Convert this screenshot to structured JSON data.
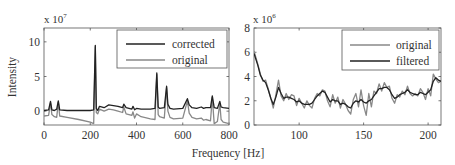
{
  "figure": {
    "xlabel": "Frequency [Hz]",
    "ylabel": "Intensity"
  },
  "chart_data": [
    {
      "type": "line",
      "title": "",
      "xlabel": "Frequency [Hz]",
      "ylabel": "Intensity",
      "y_multiplier": "x 10^7",
      "y_multiplier_base": "x 10",
      "y_multiplier_exp": "7",
      "xlim": [
        0,
        800
      ],
      "ylim": [
        -2,
        12
      ],
      "xticks": [
        0,
        200,
        400,
        600,
        800
      ],
      "yticks": [
        0,
        5,
        10
      ],
      "xtick_labels": [
        "0",
        "200",
        "400",
        "600",
        "800"
      ],
      "ytick_labels": [
        "0",
        "5",
        "10"
      ],
      "grid": false,
      "legend_position": "upper right",
      "legend": [
        "corrected",
        "original"
      ],
      "series": [
        {
          "name": "corrected",
          "color": "#222222",
          "x": [
            0,
            20,
            28,
            34,
            45,
            55,
            62,
            68,
            100,
            150,
            200,
            215,
            222,
            226,
            232,
            240,
            260,
            280,
            300,
            320,
            340,
            345,
            355,
            380,
            385,
            392,
            400,
            420,
            460,
            480,
            488,
            494,
            500,
            520,
            530,
            536,
            545,
            560,
            600,
            620,
            628,
            640,
            660,
            680,
            690,
            700,
            720,
            728,
            736,
            750,
            760,
            766,
            775,
            800
          ],
          "values": [
            0.1,
            0.2,
            1.4,
            0.2,
            0.1,
            0.3,
            1.5,
            0.2,
            0.1,
            0.1,
            0.1,
            0.2,
            9.5,
            0.4,
            0.1,
            0.7,
            0.5,
            0.9,
            0.8,
            0.7,
            0.5,
            1.0,
            0.5,
            0.3,
            0.7,
            0.2,
            0.4,
            0.3,
            0.3,
            0.4,
            5.5,
            0.6,
            0.4,
            0.5,
            3.6,
            1.0,
            0.4,
            0.3,
            0.4,
            1.8,
            0.9,
            0.5,
            0.4,
            0.6,
            0.4,
            0.5,
            0.5,
            2.2,
            0.5,
            0.4,
            1.4,
            0.6,
            0.5,
            0.4
          ]
        },
        {
          "name": "original",
          "color": "#888888",
          "x": [
            0,
            20,
            28,
            34,
            45,
            55,
            62,
            68,
            100,
            150,
            200,
            215,
            222,
            226,
            232,
            240,
            260,
            280,
            300,
            320,
            340,
            345,
            355,
            380,
            385,
            392,
            400,
            420,
            460,
            480,
            488,
            494,
            500,
            520,
            530,
            536,
            545,
            560,
            600,
            620,
            628,
            640,
            660,
            680,
            690,
            700,
            720,
            728,
            736,
            750,
            760,
            766,
            775,
            800
          ],
          "values": [
            -0.7,
            -0.6,
            1.2,
            -0.5,
            -0.8,
            -0.9,
            1.3,
            -0.7,
            -0.9,
            -1.2,
            -1.6,
            -1.8,
            9.3,
            -0.2,
            -0.4,
            0.3,
            0.0,
            0.3,
            0.2,
            0.0,
            -0.2,
            0.6,
            -0.4,
            -0.6,
            -0.1,
            -1.0,
            -0.4,
            -0.8,
            -1.1,
            -1.2,
            5.3,
            -0.5,
            -0.8,
            -1.0,
            3.4,
            0.0,
            -0.9,
            -1.1,
            -1.0,
            1.5,
            -0.3,
            -0.9,
            -1.1,
            -1.0,
            -1.3,
            -1.2,
            -1.4,
            2.0,
            -1.8,
            -1.5,
            1.1,
            -1.2,
            -1.6,
            -1.8
          ]
        }
      ]
    },
    {
      "type": "line",
      "title": "",
      "xlabel": "Frequency [Hz]",
      "ylabel": "",
      "y_multiplier": "x 10^6",
      "y_multiplier_base": "x 10",
      "y_multiplier_exp": "6",
      "xlim": [
        65,
        210
      ],
      "ylim": [
        0,
        8
      ],
      "xticks": [
        100,
        150,
        200
      ],
      "yticks": [
        0,
        2,
        4,
        6,
        8
      ],
      "xtick_labels": [
        "100",
        "150",
        "200"
      ],
      "ytick_labels": [
        "0",
        "2",
        "4",
        "6",
        "8"
      ],
      "grid": false,
      "legend_position": "upper right",
      "legend": [
        "original",
        "filtered"
      ],
      "series": [
        {
          "name": "original",
          "color": "#888888",
          "x": [
            65,
            68,
            70,
            72,
            74,
            76,
            78,
            80,
            82,
            84,
            86,
            88,
            90,
            92,
            94,
            96,
            98,
            100,
            102,
            104,
            106,
            108,
            110,
            112,
            114,
            116,
            118,
            120,
            122,
            124,
            126,
            128,
            130,
            132,
            134,
            136,
            138,
            140,
            142,
            144,
            146,
            148,
            150,
            152,
            154,
            156,
            158,
            160,
            162,
            164,
            166,
            168,
            170,
            172,
            174,
            176,
            178,
            180,
            182,
            184,
            186,
            188,
            190,
            192,
            194,
            196,
            198,
            200,
            202,
            204,
            206,
            208,
            210
          ],
          "values": [
            6.1,
            5.0,
            4.2,
            3.6,
            3.7,
            3.0,
            2.2,
            1.4,
            2.5,
            3.7,
            2.4,
            2.0,
            2.6,
            2.1,
            2.5,
            2.4,
            1.6,
            2.2,
            1.8,
            1.4,
            2.0,
            1.6,
            1.4,
            2.2,
            2.6,
            2.4,
            2.9,
            2.8,
            2.0,
            1.5,
            2.5,
            1.8,
            2.3,
            1.4,
            2.1,
            1.7,
            1.2,
            0.9,
            2.1,
            2.6,
            1.5,
            2.9,
            1.6,
            0.8,
            2.6,
            1.5,
            2.8,
            2.6,
            3.4,
            2.8,
            3.5,
            3.1,
            3.2,
            2.2,
            1.8,
            2.5,
            2.3,
            2.8,
            2.5,
            3.2,
            2.6,
            2.4,
            2.6,
            2.4,
            3.0,
            2.7,
            2.1,
            3.0,
            2.4,
            4.2,
            3.8,
            3.5,
            3.6
          ]
        },
        {
          "name": "filtered",
          "color": "#222222",
          "x": [
            65,
            68,
            70,
            72,
            74,
            76,
            78,
            80,
            82,
            84,
            86,
            88,
            90,
            92,
            94,
            96,
            98,
            100,
            102,
            104,
            106,
            108,
            110,
            112,
            114,
            116,
            118,
            120,
            122,
            124,
            126,
            128,
            130,
            132,
            134,
            136,
            138,
            140,
            142,
            144,
            146,
            148,
            150,
            152,
            154,
            156,
            158,
            160,
            162,
            164,
            166,
            168,
            170,
            172,
            174,
            176,
            178,
            180,
            182,
            184,
            186,
            188,
            190,
            192,
            194,
            196,
            198,
            200,
            202,
            204,
            206,
            208,
            210
          ],
          "values": [
            5.9,
            4.9,
            4.1,
            3.7,
            3.5,
            2.9,
            2.2,
            1.7,
            2.3,
            3.1,
            2.6,
            2.2,
            2.3,
            2.3,
            2.2,
            2.1,
            1.9,
            2.0,
            1.8,
            1.7,
            1.7,
            1.7,
            1.8,
            2.1,
            2.4,
            2.6,
            2.8,
            2.7,
            2.3,
            1.9,
            2.1,
            2.0,
            2.0,
            1.7,
            1.8,
            1.7,
            1.5,
            1.4,
            1.8,
            2.0,
            1.9,
            2.1,
            1.9,
            1.8,
            2.0,
            2.1,
            2.4,
            2.7,
            3.0,
            3.0,
            3.1,
            3.1,
            2.9,
            2.5,
            2.2,
            2.3,
            2.5,
            2.6,
            2.7,
            2.9,
            2.7,
            2.6,
            2.5,
            2.5,
            2.7,
            2.6,
            2.5,
            2.7,
            2.9,
            3.6,
            3.9,
            3.7,
            3.6
          ]
        }
      ]
    }
  ]
}
